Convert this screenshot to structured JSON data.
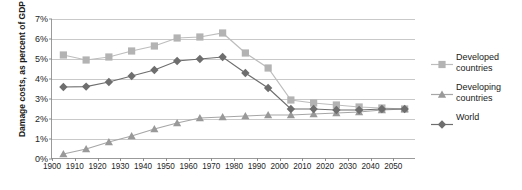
{
  "chart_data": {
    "type": "line",
    "title": "",
    "xlabel": "",
    "ylabel": "Damage costs, as percent of GDP",
    "xlim": [
      1900,
      2060
    ],
    "ylim": [
      0,
      7
    ],
    "ytick_labels": [
      "0%",
      "1%",
      "2%",
      "3%",
      "4%",
      "5%",
      "6%",
      "7%"
    ],
    "ytick_values": [
      0,
      1,
      2,
      3,
      4,
      5,
      6,
      7
    ],
    "xtick_labels": [
      "1900",
      "1910",
      "1920",
      "1930",
      "1940",
      "1950",
      "1960",
      "1970",
      "1980",
      "1990",
      "2000",
      "2010",
      "2020",
      "2030",
      "2040",
      "2050"
    ],
    "xtick_values": [
      1900,
      1910,
      1920,
      1930,
      1940,
      1950,
      1960,
      1970,
      1980,
      1990,
      2000,
      2010,
      2020,
      2030,
      2040,
      2050
    ],
    "grid": true,
    "legend_position": "right",
    "x": [
      1905,
      1915,
      1925,
      1935,
      1945,
      1955,
      1965,
      1975,
      1985,
      1995,
      2005,
      2015,
      2025,
      2035,
      2045,
      2055
    ],
    "series": [
      {
        "name": "Developed countries",
        "marker": "square",
        "color": "#b3b3b3",
        "line_color": "#bdbdbd",
        "values": [
          5.2,
          4.95,
          5.1,
          5.4,
          5.65,
          6.05,
          6.1,
          6.3,
          5.3,
          4.55,
          2.95,
          2.8,
          2.7,
          2.6,
          2.55,
          2.5
        ]
      },
      {
        "name": "Developing countries",
        "marker": "triangle",
        "color": "#999999",
        "line_color": "#a6a6a6",
        "values": [
          0.25,
          0.5,
          0.85,
          1.15,
          1.5,
          1.8,
          2.05,
          2.1,
          2.15,
          2.2,
          2.2,
          2.25,
          2.3,
          2.35,
          2.45,
          2.5
        ]
      },
      {
        "name": "World",
        "marker": "diamond",
        "color": "#6e6e6e",
        "line_color": "#6e6e6e",
        "values": [
          3.6,
          3.62,
          3.85,
          4.15,
          4.45,
          4.9,
          5.0,
          5.1,
          4.3,
          3.55,
          2.5,
          2.5,
          2.45,
          2.45,
          2.5,
          2.5
        ]
      }
    ]
  },
  "legend": {
    "items": [
      {
        "label_line1": "Developed",
        "label_line2": "countries"
      },
      {
        "label_line1": "Developing",
        "label_line2": "countries"
      },
      {
        "label_line1": "World",
        "label_line2": ""
      }
    ]
  }
}
